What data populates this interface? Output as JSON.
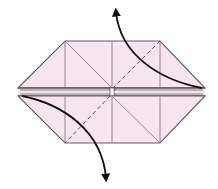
{
  "diagram": {
    "type": "origami-fold-step",
    "colors": {
      "paper": "#f6e4f0",
      "edge": "#6a5a66",
      "crease": "#8a7a86",
      "arrow": "#111111",
      "background": "#ffffff"
    },
    "elements": {
      "upper_flap": "upper-flap",
      "lower_flap": "lower-flap",
      "valley_fold_upper": "dashed-valley-fold",
      "valley_fold_lower": "dashed-valley-fold",
      "arrow_up": "fold-arrow-up",
      "arrow_down": "fold-arrow-down"
    }
  }
}
